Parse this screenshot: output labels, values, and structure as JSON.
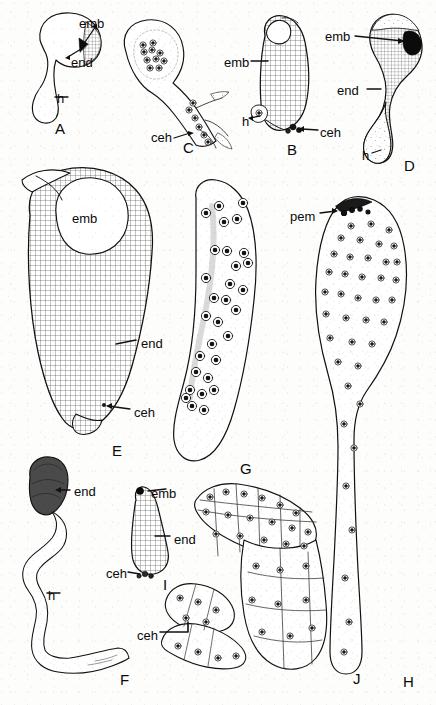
{
  "figure": {
    "type": "scientific-illustration",
    "background_color": "#fdfdfc",
    "ink_color": "#0a0a0a",
    "panel_count": 10
  },
  "panels": [
    {
      "letter": "A",
      "x": 55,
      "y": 121
    },
    {
      "letter": "B",
      "x": 287,
      "y": 142
    },
    {
      "letter": "C",
      "x": 183,
      "y": 140
    },
    {
      "letter": "D",
      "x": 404,
      "y": 158
    },
    {
      "letter": "E",
      "x": 112,
      "y": 443
    },
    {
      "letter": "F",
      "x": 120,
      "y": 672
    },
    {
      "letter": "G",
      "x": 240,
      "y": 461
    },
    {
      "letter": "H",
      "x": 403,
      "y": 674
    },
    {
      "letter": "I",
      "x": 163,
      "y": 577
    },
    {
      "letter": "J",
      "x": 353,
      "y": 671
    }
  ],
  "annotations": [
    {
      "id": "a-emb",
      "text": "emb",
      "x": 79,
      "y": 17,
      "panel": "A"
    },
    {
      "id": "a-end",
      "text": "end",
      "x": 71,
      "y": 56,
      "panel": "A"
    },
    {
      "id": "a-h",
      "text": "h",
      "x": 57,
      "y": 92,
      "panel": "A"
    },
    {
      "id": "c-ceh",
      "text": "ceh",
      "x": 151,
      "y": 131,
      "panel": "C"
    },
    {
      "id": "b-emb",
      "text": "emb",
      "x": 224,
      "y": 56,
      "panel": "B"
    },
    {
      "id": "b-h",
      "text": "h",
      "x": 242,
      "y": 115,
      "panel": "B"
    },
    {
      "id": "b-ceh",
      "text": "ceh",
      "x": 320,
      "y": 126,
      "panel": "B"
    },
    {
      "id": "d-emb",
      "text": "emb",
      "x": 325,
      "y": 30,
      "panel": "D"
    },
    {
      "id": "d-end",
      "text": "end",
      "x": 337,
      "y": 84,
      "panel": "D"
    },
    {
      "id": "d-h",
      "text": "h",
      "x": 362,
      "y": 149,
      "panel": "D"
    },
    {
      "id": "e-emb",
      "text": "emb",
      "x": 72,
      "y": 212,
      "panel": "E"
    },
    {
      "id": "e-end",
      "text": "end",
      "x": 141,
      "y": 337,
      "panel": "E"
    },
    {
      "id": "e-ceh",
      "text": "ceh",
      "x": 134,
      "y": 406,
      "panel": "E"
    },
    {
      "id": "h-pem",
      "text": "pem",
      "x": 290,
      "y": 210,
      "panel": "H"
    },
    {
      "id": "f-end",
      "text": "end",
      "x": 74,
      "y": 485,
      "panel": "F"
    },
    {
      "id": "f-h",
      "text": "h",
      "x": 48,
      "y": 589,
      "panel": "F"
    },
    {
      "id": "i-emb",
      "text": "emb",
      "x": 151,
      "y": 487,
      "panel": "I"
    },
    {
      "id": "i-end",
      "text": "end",
      "x": 174,
      "y": 533,
      "panel": "I"
    },
    {
      "id": "i-ceh",
      "text": "ceh",
      "x": 106,
      "y": 567,
      "panel": "I"
    },
    {
      "id": "j-ceh",
      "text": "ceh",
      "x": 137,
      "y": 629,
      "panel": "J"
    }
  ]
}
